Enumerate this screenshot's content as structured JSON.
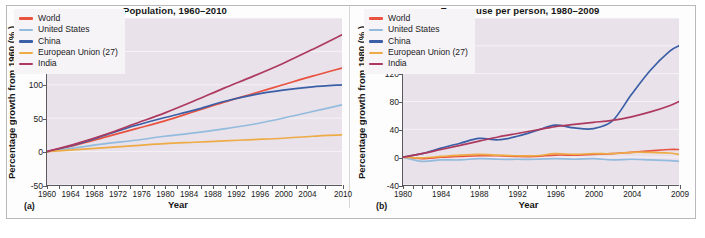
{
  "figure": {
    "background": "#ffffff",
    "frame_border": "#b9b9bd",
    "plot_background": "#e9e2eb"
  },
  "series_colors": {
    "world": "#e8523f",
    "united_states": "#93bbdd",
    "china": "#3a5fa6",
    "european_union": "#eeab45",
    "india": "#ad3a5e"
  },
  "legend": {
    "items": [
      {
        "key": "world",
        "label": "World",
        "color": "#e8523f"
      },
      {
        "key": "united_states",
        "label": "United States",
        "color": "#93bbdd"
      },
      {
        "key": "china",
        "label": "China",
        "color": "#3a5fa6"
      },
      {
        "key": "european_union",
        "label": "European Union (27)",
        "color": "#eeab45"
      },
      {
        "key": "india",
        "label": "India",
        "color": "#ad3a5e"
      }
    ]
  },
  "panel_a": {
    "tag": "(a)",
    "title": "Population, 1960–2010",
    "ylabel": "Percentage growth from 1960 (% )",
    "xlabel": "Year",
    "yticks": [
      200,
      150,
      100,
      50,
      0,
      -50
    ],
    "xticks": [
      1960,
      1964,
      1968,
      1972,
      1976,
      1980,
      1984,
      1988,
      1992,
      1996,
      2000,
      2004,
      2010
    ]
  },
  "panel_b": {
    "tag": "(b)",
    "title": "Energy use per person, 1980–2009",
    "ylabel": "Percentage growth from 1980 (% )",
    "xlabel": "Year",
    "yticks": [
      200,
      160,
      120,
      80,
      40,
      0,
      -40
    ],
    "xticks": [
      1980,
      1984,
      1988,
      1992,
      1996,
      2000,
      2004,
      2009
    ]
  },
  "chart_data": [
    {
      "type": "line",
      "panel": "(a)",
      "title": "Population, 1960–2010",
      "xlabel": "Year",
      "ylabel": "Percentage growth from 1960 (%)",
      "xlim": [
        1960,
        2010
      ],
      "ylim": [
        -50,
        200
      ],
      "grid": false,
      "legend_position": "top-left",
      "x": [
        1960,
        1965,
        1970,
        1975,
        1980,
        1985,
        1990,
        1995,
        2000,
        2005,
        2010
      ],
      "series": [
        {
          "name": "World",
          "color": "#e8523f",
          "values": [
            0,
            10,
            22,
            34,
            46,
            60,
            74,
            87,
            100,
            113,
            125
          ]
        },
        {
          "name": "United States",
          "color": "#93bbdd",
          "values": [
            0,
            6,
            12,
            17,
            23,
            28,
            34,
            41,
            50,
            60,
            70
          ]
        },
        {
          "name": "China",
          "color": "#3a5fa6",
          "values": [
            0,
            11,
            25,
            39,
            51,
            62,
            75,
            85,
            92,
            97,
            100
          ]
        },
        {
          "name": "European Union (27)",
          "color": "#eeab45",
          "values": [
            0,
            3,
            6,
            9,
            12,
            14,
            16,
            18,
            20,
            23,
            25
          ]
        },
        {
          "name": "India",
          "color": "#ad3a5e",
          "values": [
            0,
            12,
            26,
            42,
            58,
            76,
            95,
            113,
            132,
            153,
            175
          ]
        }
      ]
    },
    {
      "type": "line",
      "panel": "(b)",
      "title": "Energy use per person, 1980–2009",
      "xlabel": "Year",
      "ylabel": "Percentage growth from 1980 (%)",
      "xlim": [
        1980,
        2009
      ],
      "ylim": [
        -40,
        200
      ],
      "grid": false,
      "legend_position": "top-left",
      "x": [
        1980,
        1982,
        1984,
        1986,
        1988,
        1990,
        1992,
        1994,
        1996,
        1998,
        2000,
        2002,
        2004,
        2006,
        2008,
        2009
      ],
      "series": [
        {
          "name": "World",
          "color": "#e8523f",
          "values": [
            0,
            -2,
            0,
            1,
            2,
            2,
            1,
            1,
            3,
            3,
            4,
            5,
            7,
            9,
            11,
            11
          ]
        },
        {
          "name": "United States",
          "color": "#93bbdd",
          "values": [
            0,
            -6,
            -4,
            -4,
            -2,
            -3,
            -3,
            -3,
            -2,
            -3,
            -2,
            -4,
            -3,
            -4,
            -5,
            -6
          ]
        },
        {
          "name": "China",
          "color": "#3a5fa6",
          "values": [
            0,
            5,
            13,
            20,
            27,
            25,
            30,
            38,
            46,
            42,
            41,
            52,
            90,
            125,
            152,
            160
          ]
        },
        {
          "name": "European Union (27)",
          "color": "#eeab45",
          "values": [
            0,
            -1,
            1,
            3,
            4,
            3,
            2,
            2,
            5,
            4,
            5,
            5,
            7,
            7,
            6,
            4
          ]
        },
        {
          "name": "India",
          "color": "#ad3a5e",
          "values": [
            0,
            5,
            11,
            17,
            23,
            29,
            34,
            39,
            44,
            47,
            50,
            53,
            58,
            65,
            74,
            80
          ]
        }
      ]
    }
  ]
}
